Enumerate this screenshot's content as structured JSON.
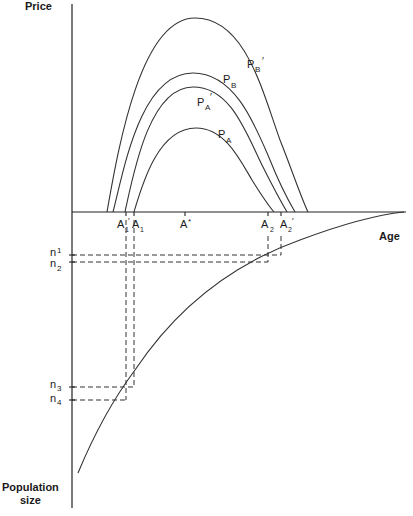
{
  "axes": {
    "y_top_label": "Price",
    "y_bottom_label_line1": "Population",
    "y_bottom_label_line2": "size",
    "x_label": "Age"
  },
  "curves": [
    {
      "id": "PB_prime",
      "label_main": "P",
      "label_sub": "B",
      "label_prime": "′"
    },
    {
      "id": "PB",
      "label_main": "P",
      "label_sub": "B",
      "label_prime": ""
    },
    {
      "id": "PA_prime",
      "label_main": "P",
      "label_sub": "A",
      "label_prime": "′"
    },
    {
      "id": "PA",
      "label_main": "P",
      "label_sub": "A",
      "label_prime": ""
    }
  ],
  "age_ticks": [
    {
      "id": "A1_prime",
      "main": "A",
      "sub": "1",
      "prime": "′"
    },
    {
      "id": "A1",
      "main": "A",
      "sub": "1",
      "prime": ""
    },
    {
      "id": "A_star",
      "main": "A",
      "sub": "",
      "prime": "*"
    },
    {
      "id": "A2",
      "main": "A",
      "sub": "2",
      "prime": ""
    },
    {
      "id": "A2_prime",
      "main": "A",
      "sub": "2",
      "prime": "′"
    }
  ],
  "population_ticks": [
    {
      "id": "n1",
      "main": "n",
      "sub": "1"
    },
    {
      "id": "n2",
      "main": "n",
      "sub": "2"
    },
    {
      "id": "n3",
      "main": "n",
      "sub": "3"
    },
    {
      "id": "n4",
      "main": "n",
      "sub": "4"
    }
  ]
}
